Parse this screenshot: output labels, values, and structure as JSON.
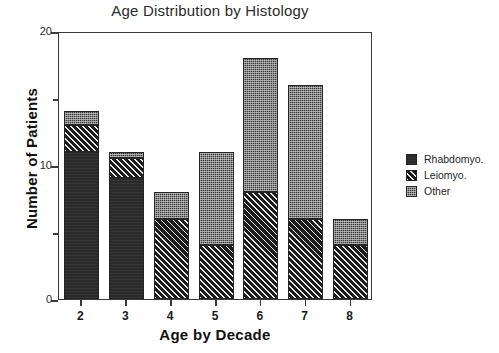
{
  "chart_data": {
    "type": "bar",
    "subtype": "stacked-bar",
    "title": "Age Distribution by Histology",
    "xlabel": "Age by Decade",
    "ylabel": "Number of Patients",
    "categories": [
      "2",
      "3",
      "4",
      "5",
      "6",
      "7",
      "8"
    ],
    "ylim": [
      0,
      20
    ],
    "yticks": [
      0,
      10,
      20
    ],
    "ytick_labels": [
      "0",
      "10",
      "20"
    ],
    "yminor_ticks": [
      5,
      15
    ],
    "grid": false,
    "legend_position": "right",
    "series": [
      {
        "name": "Rhabdomyo.",
        "pattern": "solid-dark",
        "values": [
          11,
          9,
          0,
          0,
          0,
          0,
          0
        ]
      },
      {
        "name": "Leiomyo.",
        "pattern": "diagonal-hatch",
        "values": [
          2,
          1.5,
          6,
          4,
          8,
          6,
          4
        ]
      },
      {
        "name": "Other",
        "pattern": "stipple",
        "values": [
          1,
          0.5,
          2,
          7,
          10,
          10,
          2
        ]
      }
    ],
    "totals": [
      14,
      11,
      8,
      11,
      18,
      16,
      6
    ]
  },
  "legend": {
    "items": [
      {
        "label": "Rhabdomyo."
      },
      {
        "label": "Leiomyo."
      },
      {
        "label": "Other"
      }
    ]
  },
  "colors": {
    "rhabdomyo": "#2a2a2a",
    "leiomyo": "#1f1f1f",
    "other": "#3a3a3a",
    "axis": "#3a3a3a",
    "background": "#ffffff"
  }
}
